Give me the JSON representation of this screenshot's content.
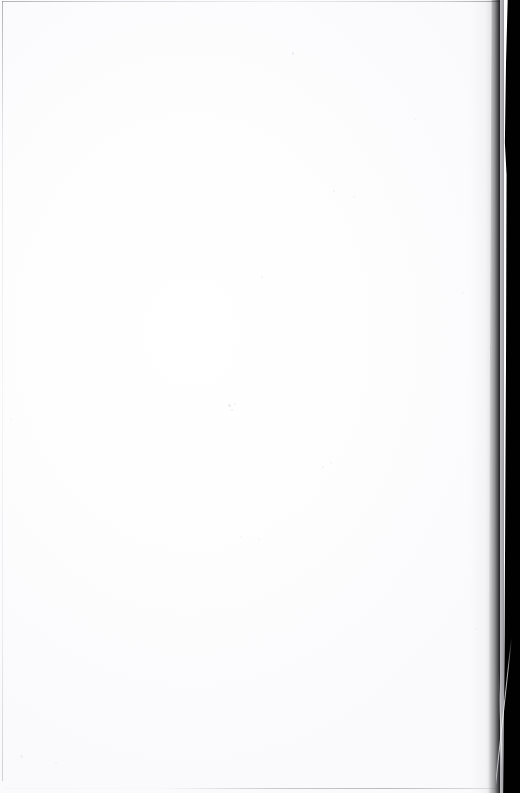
{
  "document": {
    "kind": "scanned-page",
    "page_state": "blank",
    "visible_text": "",
    "width_px": 520,
    "height_px": 793
  },
  "colors": {
    "paper": "#fefeff",
    "gutter": "#010101",
    "edge_rule": "#8a8a92",
    "speck": "#c9c9cf",
    "curl_highlight": "#f4f4f6"
  },
  "regions": {
    "paper_label": "",
    "gutter_label": "",
    "curl_label": ""
  },
  "specks": [
    {
      "x": 292,
      "y": 52,
      "w": 2,
      "h": 3,
      "o": 0.3
    },
    {
      "x": 228,
      "y": 404,
      "w": 3,
      "h": 3,
      "o": 0.34
    },
    {
      "x": 231,
      "y": 409,
      "w": 2,
      "h": 2,
      "o": 0.26
    },
    {
      "x": 333,
      "y": 190,
      "w": 2,
      "h": 2,
      "o": 0.22
    },
    {
      "x": 353,
      "y": 196,
      "w": 2,
      "h": 2,
      "o": 0.18
    },
    {
      "x": 261,
      "y": 276,
      "w": 2,
      "h": 2,
      "o": 0.2
    },
    {
      "x": 322,
      "y": 466,
      "w": 2,
      "h": 2,
      "o": 0.2
    },
    {
      "x": 330,
      "y": 462,
      "w": 2,
      "h": 2,
      "o": 0.16
    },
    {
      "x": 258,
      "y": 538,
      "w": 2,
      "h": 2,
      "o": 0.16
    },
    {
      "x": 234,
      "y": 403,
      "w": 2,
      "h": 2,
      "o": 0.18
    },
    {
      "x": 20,
      "y": 755,
      "w": 3,
      "h": 3,
      "o": 0.2
    },
    {
      "x": 55,
      "y": 762,
      "w": 2,
      "h": 2,
      "o": 0.18
    },
    {
      "x": 240,
      "y": 536,
      "w": 2,
      "h": 2,
      "o": 0.14
    },
    {
      "x": 462,
      "y": 292,
      "w": 2,
      "h": 2,
      "o": 0.16
    },
    {
      "x": 489,
      "y": 347,
      "w": 2,
      "h": 2,
      "o": 0.18
    },
    {
      "x": 10,
      "y": 418,
      "w": 2,
      "h": 2,
      "o": 0.16
    },
    {
      "x": 414,
      "y": 118,
      "w": 2,
      "h": 2,
      "o": 0.14
    },
    {
      "x": 475,
      "y": 628,
      "w": 2,
      "h": 2,
      "o": 0.16
    }
  ]
}
